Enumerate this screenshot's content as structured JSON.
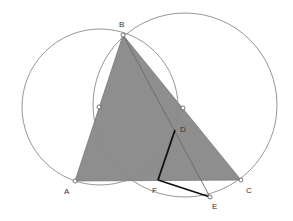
{
  "diagram": {
    "type": "geometry",
    "colors": {
      "triangle_fill": "#8e8e8e",
      "circle_stroke": "#8a8a8a",
      "line_stroke": "#6a6a6a",
      "thick_segment": "#111111",
      "point_fill": "#ffffff",
      "point_stroke": "#555555"
    },
    "points": {
      "A": {
        "label": "A",
        "x": 75,
        "y": 181
      },
      "B": {
        "label": "B",
        "x": 123,
        "y": 35
      },
      "C": {
        "label": "C",
        "x": 241,
        "y": 180
      },
      "D": {
        "label": "D",
        "x": 175,
        "y": 130
      },
      "E": {
        "label": "E",
        "x": 210,
        "y": 197
      },
      "F": {
        "label": "F",
        "x": 158,
        "y": 180
      },
      "O1": {
        "label": "",
        "x": 99,
        "y": 107
      },
      "O2": {
        "label": "",
        "x": 183,
        "y": 108
      }
    },
    "circles": [
      {
        "name": "left-circle",
        "cx": 100,
        "cy": 107,
        "r": 78
      },
      {
        "name": "right-circle",
        "cx": 185,
        "cy": 105,
        "r": 92
      }
    ],
    "triangle": [
      "A",
      "B",
      "C"
    ],
    "segments": [
      {
        "from": "B",
        "to": "E",
        "style": "thin"
      },
      {
        "from": "D",
        "to": "F",
        "style": "thick"
      },
      {
        "from": "F",
        "to": "E",
        "style": "thick"
      }
    ],
    "labels": {
      "A": "A",
      "B": "B",
      "C": "C",
      "D": "D",
      "E": "E",
      "F": "F"
    }
  }
}
